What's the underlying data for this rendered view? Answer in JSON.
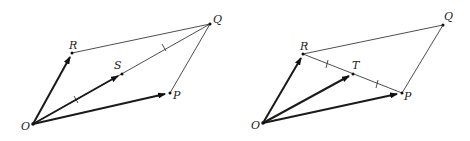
{
  "figures": [
    {
      "name": "left-parallelogram",
      "points": {
        "O": {
          "label": "O",
          "x": 33,
          "y": 124
        },
        "R": {
          "label": "R",
          "x": 72,
          "y": 53
        },
        "P": {
          "label": "P",
          "x": 170,
          "y": 93
        },
        "Q": {
          "label": "Q",
          "x": 210,
          "y": 24
        },
        "S": {
          "label": "S",
          "x": 122,
          "y": 74
        }
      },
      "vectors": [
        "OR",
        "OS",
        "OP"
      ],
      "segments": [
        "RQ",
        "PQ",
        "OQ"
      ],
      "equal_marks_on": "OQ"
    },
    {
      "name": "right-parallelogram",
      "points": {
        "O": {
          "label": "O",
          "x": 263,
          "y": 123
        },
        "R": {
          "label": "R",
          "x": 303,
          "y": 54
        },
        "P": {
          "label": "P",
          "x": 402,
          "y": 93
        },
        "Q": {
          "label": "Q",
          "x": 443,
          "y": 25
        },
        "T": {
          "label": "T",
          "x": 353,
          "y": 74
        }
      },
      "vectors": [
        "OR",
        "OT",
        "OP"
      ],
      "segments": [
        "RQ",
        "PQ",
        "RP"
      ],
      "equal_marks_on": "RP"
    }
  ],
  "labels": {
    "left_O": "O",
    "left_R": "R",
    "left_S": "S",
    "left_P": "P",
    "left_Q": "Q",
    "right_O": "O",
    "right_R": "R",
    "right_T": "T",
    "right_P": "P",
    "right_Q": "Q"
  },
  "colors": {
    "line": "#3a3a3a",
    "vector": "#1a1a1a",
    "background": "#ffffff"
  }
}
